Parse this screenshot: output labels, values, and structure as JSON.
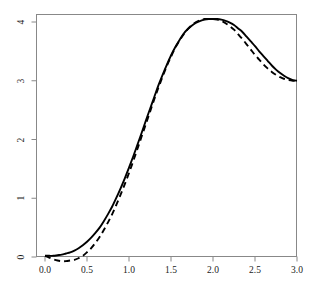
{
  "chart_data": {
    "type": "line",
    "title": "",
    "subtitle": "",
    "xlabel": "",
    "ylabel": "",
    "xlim": [
      -0.06,
      3.06
    ],
    "ylim": [
      -0.18,
      4.22
    ],
    "grid": false,
    "legend": "none",
    "background_color": "#ffffff",
    "axis_color": "#888888",
    "tick_label_color": "#1a1a1a",
    "x_ticks": [
      {
        "value": 0.0,
        "label": "0.0"
      },
      {
        "value": 0.5,
        "label": "0.5"
      },
      {
        "value": 1.0,
        "label": "1.0"
      },
      {
        "value": 1.5,
        "label": "1.5"
      },
      {
        "value": 2.0,
        "label": "2.0"
      },
      {
        "value": 2.5,
        "label": "2.5"
      },
      {
        "value": 3.0,
        "label": "3.0"
      }
    ],
    "y_ticks": [
      {
        "value": 0,
        "label": "0"
      },
      {
        "value": 1,
        "label": "1"
      },
      {
        "value": 2,
        "label": "2"
      },
      {
        "value": 3,
        "label": "3"
      },
      {
        "value": 4,
        "label": "4"
      }
    ],
    "series": [
      {
        "name": "solid-curve",
        "style": "solid",
        "color": "#000000",
        "line_width": 1.9,
        "x": [
          0.0,
          0.05,
          0.1,
          0.15,
          0.2,
          0.25,
          0.3,
          0.35,
          0.4,
          0.45,
          0.5,
          0.55,
          0.6,
          0.65,
          0.7,
          0.75,
          0.8,
          0.85,
          0.9,
          0.95,
          1.0,
          1.05,
          1.1,
          1.15,
          1.2,
          1.25,
          1.3,
          1.35,
          1.4,
          1.45,
          1.5,
          1.55,
          1.6,
          1.65,
          1.7,
          1.75,
          1.8,
          1.85,
          1.9,
          1.95,
          2.0,
          2.05,
          2.1,
          2.15,
          2.2,
          2.25,
          2.3,
          2.35,
          2.4,
          2.45,
          2.5,
          2.55,
          2.6,
          2.65,
          2.7,
          2.75,
          2.8,
          2.85,
          2.9,
          2.95,
          3.0
        ],
        "y": [
          0.02,
          0.02,
          0.02,
          0.03,
          0.04,
          0.06,
          0.08,
          0.11,
          0.15,
          0.2,
          0.26,
          0.33,
          0.41,
          0.5,
          0.61,
          0.73,
          0.86,
          1.01,
          1.17,
          1.34,
          1.52,
          1.71,
          1.91,
          2.11,
          2.32,
          2.52,
          2.72,
          2.92,
          3.1,
          3.27,
          3.43,
          3.57,
          3.69,
          3.8,
          3.88,
          3.94,
          3.99,
          4.02,
          4.04,
          4.05,
          4.05,
          4.05,
          4.04,
          4.02,
          3.99,
          3.95,
          3.89,
          3.83,
          3.75,
          3.67,
          3.59,
          3.5,
          3.42,
          3.34,
          3.26,
          3.19,
          3.13,
          3.08,
          3.04,
          3.01,
          3.0
        ]
      },
      {
        "name": "dashed-curve",
        "style": "dashed",
        "color": "#000000",
        "line_width": 1.9,
        "dash_pattern": "6,4",
        "x": [
          0.0,
          0.05,
          0.1,
          0.15,
          0.2,
          0.25,
          0.3,
          0.35,
          0.4,
          0.45,
          0.5,
          0.55,
          0.6,
          0.65,
          0.7,
          0.75,
          0.8,
          0.85,
          0.9,
          0.95,
          1.0,
          1.05,
          1.1,
          1.15,
          1.2,
          1.25,
          1.3,
          1.35,
          1.4,
          1.45,
          1.5,
          1.55,
          1.6,
          1.65,
          1.7,
          1.75,
          1.8,
          1.85,
          1.9,
          1.95,
          2.0,
          2.05,
          2.1,
          2.15,
          2.2,
          2.25,
          2.3,
          2.35,
          2.4,
          2.45,
          2.5,
          2.55,
          2.6,
          2.65,
          2.7,
          2.75,
          2.8,
          2.85,
          2.9,
          2.95,
          3.0
        ],
        "y": [
          0.02,
          -0.01,
          -0.04,
          -0.06,
          -0.07,
          -0.07,
          -0.06,
          -0.05,
          -0.02,
          0.02,
          0.08,
          0.15,
          0.24,
          0.34,
          0.46,
          0.59,
          0.73,
          0.89,
          1.06,
          1.24,
          1.43,
          1.63,
          1.84,
          2.05,
          2.26,
          2.47,
          2.68,
          2.88,
          3.07,
          3.25,
          3.41,
          3.56,
          3.68,
          3.79,
          3.88,
          3.95,
          4.0,
          4.03,
          4.05,
          4.05,
          4.05,
          4.04,
          4.02,
          3.98,
          3.93,
          3.87,
          3.79,
          3.71,
          3.62,
          3.53,
          3.44,
          3.36,
          3.28,
          3.21,
          3.15,
          3.1,
          3.06,
          3.03,
          3.01,
          3.0,
          3.0
        ]
      }
    ]
  }
}
